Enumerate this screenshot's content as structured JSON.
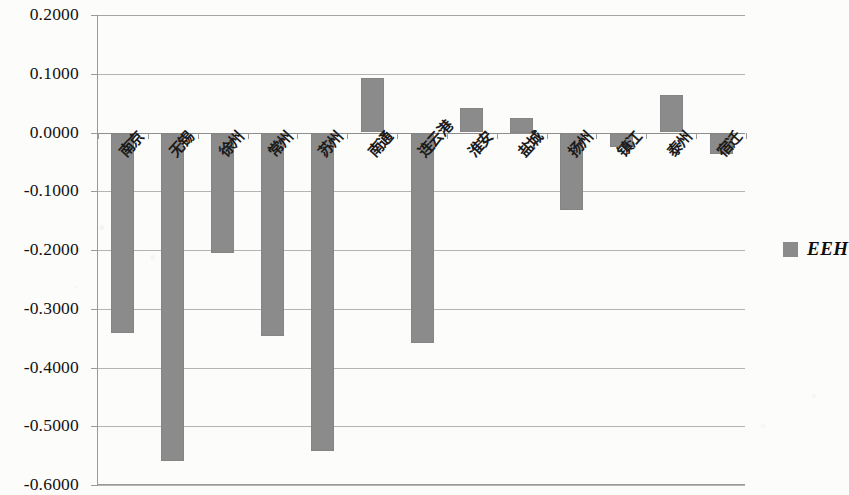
{
  "chart_data": {
    "type": "bar",
    "title": "",
    "xlabel": "",
    "ylabel": "",
    "ylim": [
      -0.6,
      0.2
    ],
    "ytick_labels": [
      "0.2000",
      "0.1000",
      "0.0000",
      "-0.1000",
      "-0.2000",
      "-0.3000",
      "-0.4000",
      "-0.5000",
      "-0.6000"
    ],
    "ytick_values": [
      0.2,
      0.1,
      0.0,
      -0.1,
      -0.2,
      -0.3,
      -0.4,
      -0.5,
      -0.6
    ],
    "grid": true,
    "legend_position": "right",
    "series": [
      {
        "name": "EEH",
        "color": "#8b8b8b",
        "values": [
          -0.342,
          -0.559,
          -0.205,
          -0.347,
          -0.542,
          0.093,
          -0.358,
          0.042,
          0.025,
          -0.132,
          -0.025,
          0.063,
          -0.037
        ]
      }
    ],
    "categories": [
      "南京",
      "无锡",
      "徐州",
      "常州",
      "苏州",
      "南通",
      "连云港",
      "淮安",
      "盐城",
      "扬州",
      "镇江",
      "泰州",
      "宿迁"
    ]
  },
  "legend": {
    "entries": [
      {
        "label": "EEH",
        "color": "#8b8b8b"
      }
    ]
  },
  "colors": {
    "bar": "#8b8b8b",
    "gridline": "#b4b4b4",
    "axis": "#9a9a9a",
    "text": "#121212",
    "background": "#fcfcfb"
  }
}
